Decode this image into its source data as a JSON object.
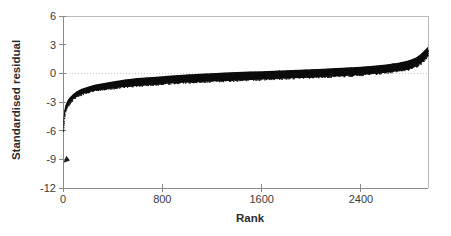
{
  "chart_data": {
    "type": "scatter",
    "title": "",
    "xlabel": "Rank",
    "ylabel": "Standardised residual",
    "xlim": [
      0,
      2940
    ],
    "ylim": [
      -12,
      6
    ],
    "xticks": [
      0,
      800,
      1600,
      2400
    ],
    "xtick_labels": [
      "0",
      "800",
      "1600",
      "2400"
    ],
    "yticks": [
      6,
      3,
      0,
      -3,
      -6,
      -9,
      -12
    ],
    "ytick_labels": [
      "6",
      "3",
      "0",
      "-3",
      "-6",
      "-9",
      "-12"
    ],
    "grid": "zero-line-only",
    "legend": "none",
    "series": [
      {
        "name": "Standardised residual by rank",
        "description": "Dense ordered band of standardised residuals; steep rise from about -6 near rank 0, flattening through zero across the middle ranks, rising to about +2.5 at the highest ranks.",
        "x": [
          0,
          5,
          10,
          20,
          35,
          55,
          80,
          110,
          150,
          200,
          260,
          330,
          410,
          500,
          600,
          700,
          800,
          900,
          1000,
          1100,
          1200,
          1300,
          1400,
          1500,
          1600,
          1700,
          1800,
          1900,
          2000,
          2100,
          2200,
          2300,
          2400,
          2500,
          2600,
          2700,
          2780,
          2840,
          2880,
          2910,
          2930,
          2940
        ],
        "y_center": [
          -6.0,
          -5.0,
          -4.3,
          -3.7,
          -3.2,
          -2.8,
          -2.45,
          -2.15,
          -1.9,
          -1.7,
          -1.5,
          -1.35,
          -1.2,
          -1.05,
          -0.92,
          -0.82,
          -0.72,
          -0.63,
          -0.55,
          -0.48,
          -0.42,
          -0.36,
          -0.3,
          -0.25,
          -0.2,
          -0.15,
          -0.1,
          -0.05,
          0.0,
          0.06,
          0.12,
          0.19,
          0.27,
          0.37,
          0.5,
          0.68,
          0.88,
          1.15,
          1.5,
          1.9,
          2.2,
          2.35
        ],
        "y_upper": [
          -5.6,
          -4.6,
          -3.95,
          -3.35,
          -2.88,
          -2.5,
          -2.18,
          -1.88,
          -1.62,
          -1.4,
          -1.18,
          -1.0,
          -0.82,
          -0.65,
          -0.5,
          -0.4,
          -0.3,
          -0.2,
          -0.12,
          -0.05,
          0.02,
          0.08,
          0.13,
          0.18,
          0.23,
          0.28,
          0.33,
          0.38,
          0.43,
          0.49,
          0.55,
          0.62,
          0.7,
          0.8,
          0.93,
          1.12,
          1.33,
          1.62,
          2.0,
          2.4,
          2.66,
          2.78
        ],
        "y_lower": [
          -6.1,
          -5.4,
          -4.65,
          -4.05,
          -3.52,
          -3.1,
          -2.72,
          -2.42,
          -2.18,
          -1.98,
          -1.8,
          -1.68,
          -1.56,
          -1.44,
          -1.32,
          -1.22,
          -1.12,
          -1.03,
          -0.96,
          -0.9,
          -0.85,
          -0.8,
          -0.75,
          -0.7,
          -0.65,
          -0.6,
          -0.55,
          -0.5,
          -0.45,
          -0.39,
          -0.33,
          -0.26,
          -0.18,
          -0.08,
          0.05,
          0.22,
          0.42,
          0.68,
          1.0,
          1.38,
          1.72,
          1.9
        ]
      },
      {
        "name": "Low outlier marker",
        "description": "Single isolated marker near rank 30 at a standardised residual of about -9.",
        "points": [
          {
            "x": 30,
            "y": -9.0
          }
        ]
      }
    ],
    "colors": {
      "data": "#0d0d0d",
      "axis": "#8a8a8a",
      "frame": "#b9b9b9",
      "grid": "#c9c9c9",
      "text": "#3a3a3a",
      "background": "#ffffff"
    }
  }
}
